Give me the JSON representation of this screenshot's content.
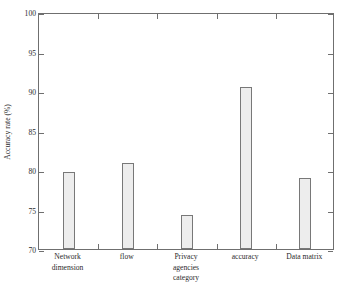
{
  "chart_data": {
    "type": "bar",
    "title": "",
    "xlabel": "",
    "ylabel": "Accuracy rate (%)",
    "categories": [
      "Network\ndimension",
      "flow",
      "Privacy\nagencies\ncategory",
      "accuracy",
      "Data matrix"
    ],
    "category_plain": [
      "Network dimension",
      "flow",
      "Privacy agencies category",
      "accuracy",
      "Data matrix"
    ],
    "values": [
      79.8,
      80.9,
      74.3,
      90.5,
      79.0
    ],
    "ylim": [
      70,
      100
    ],
    "yticks": [
      70,
      75,
      80,
      85,
      90,
      95,
      100
    ],
    "ytick_labels": [
      "70",
      "75",
      "80",
      "85",
      "90",
      "95",
      "100"
    ],
    "grid": false,
    "legend": false,
    "bar_fill_color": "#ededed",
    "bar_edge_color": "#787878",
    "axis_color": "#6f6f6f",
    "background_color": "#ffffff"
  }
}
